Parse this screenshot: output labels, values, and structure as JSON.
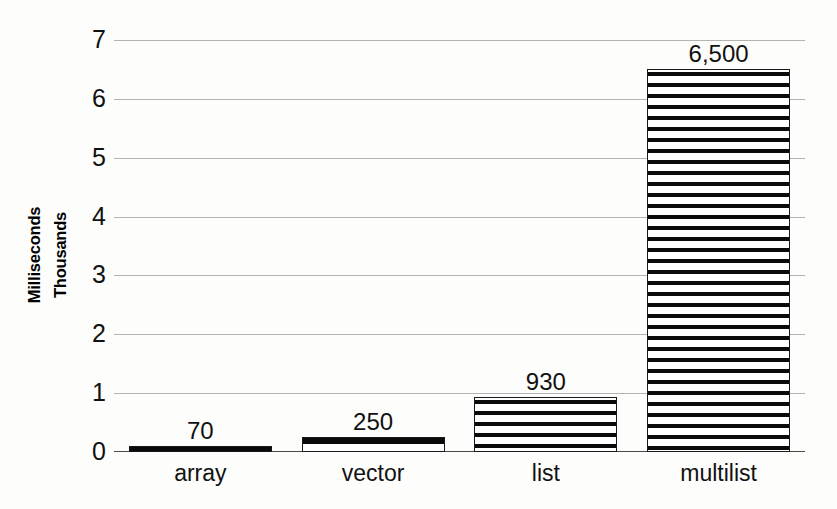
{
  "chart_data": {
    "type": "bar",
    "title": "",
    "subtitle": "",
    "xlabel": "",
    "ylabel_lines": [
      "Milliseconds",
      "Thousands"
    ],
    "ylabel": "Milliseconds Thousands",
    "categories": [
      "array",
      "vector",
      "list",
      "multilist"
    ],
    "values": [
      70,
      250,
      930,
      6500
    ],
    "value_labels": [
      "70",
      "250",
      "930",
      "6,500"
    ],
    "units": "milliseconds",
    "y_axis": {
      "ticks": [
        0,
        1,
        2,
        3,
        4,
        5,
        6,
        7
      ],
      "tick_labels": [
        "0",
        "1",
        "2",
        "3",
        "4",
        "5",
        "6",
        "7"
      ],
      "ylim": [
        0,
        7
      ],
      "scale_multiplier": 1000,
      "scale_label": "Thousands"
    },
    "grid": true,
    "grid_orientation": "horizontal",
    "legend": false,
    "legend_position": "none",
    "bar_fill": "horizontal-hatch",
    "colors": {
      "bar_fill": "#ffffff",
      "bar_hatch": "#0a0a0a",
      "bar_outline": "#1a1a1a",
      "gridline": "#9a9a9a",
      "axis": "#4a4a4a",
      "text": "#111111",
      "background": "#fdfdfc"
    }
  }
}
